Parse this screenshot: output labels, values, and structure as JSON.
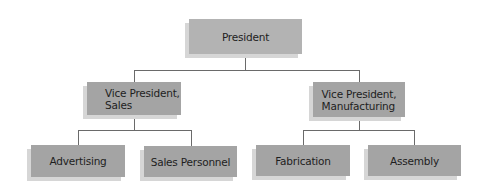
{
  "org_chart": {
    "root": {
      "label": "President"
    },
    "level1": [
      {
        "label_line1": "Vice President,",
        "label_line2": "Sales"
      },
      {
        "label_line1": "Vice President,",
        "label_line2": "Manufacturing"
      }
    ],
    "level2": [
      {
        "parent": 0,
        "label": "Advertising"
      },
      {
        "parent": 0,
        "label": "Sales Personnel"
      },
      {
        "parent": 1,
        "label": "Fabrication"
      },
      {
        "parent": 1,
        "label": "Assembly"
      }
    ]
  },
  "colors": {
    "box_fill": "#a4a4a4",
    "root_fill": "#b3b3b3",
    "shadow": "#d6d6d6",
    "connector": "#6a6a6a"
  }
}
